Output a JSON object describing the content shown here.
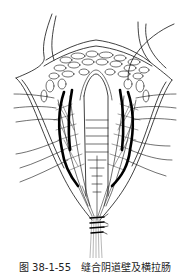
{
  "figure": {
    "colors": {
      "ink": "#111111",
      "background": "#ffffff",
      "thread": "#888888"
    }
  },
  "caption": {
    "text": "图 38-1-55　缝合阴道壁及横拉肠"
  }
}
